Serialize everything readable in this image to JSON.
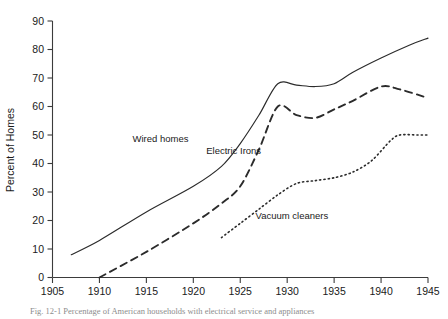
{
  "figure": {
    "caption": "Fig. 12-1  Percentage of American households with electrical service and appliances"
  },
  "chart_data": {
    "type": "line",
    "title": "",
    "xlabel": "",
    "ylabel": "Percent of Homes",
    "xlim": [
      1905,
      1945
    ],
    "ylim": [
      0,
      90
    ],
    "xticks": [
      1905,
      1910,
      1915,
      1920,
      1925,
      1930,
      1935,
      1940,
      1945
    ],
    "yticks": [
      0,
      10,
      20,
      30,
      40,
      50,
      60,
      70,
      80,
      90
    ],
    "grid": false,
    "legend_position": "inline-labels",
    "series": [
      {
        "name": "Wired homes",
        "style": "solid",
        "label_x": 1916.5,
        "label_y": 47.5,
        "x": [
          1907,
          1910,
          1915,
          1920,
          1923,
          1925,
          1927,
          1929,
          1931,
          1933,
          1935,
          1937,
          1940,
          1943,
          1945
        ],
        "values": [
          8,
          13,
          23,
          32,
          39,
          47,
          57,
          68,
          67.5,
          67,
          68,
          72,
          77,
          81.5,
          84
        ]
      },
      {
        "name": "Electric Irons",
        "style": "dashed",
        "label_x": 1924.3,
        "label_y": 43.5,
        "x": [
          1910,
          1915,
          1920,
          1923,
          1925,
          1927,
          1929,
          1931,
          1933,
          1935,
          1937,
          1940,
          1942,
          1945
        ],
        "values": [
          0,
          9,
          19,
          26,
          32,
          45,
          60,
          57,
          56,
          59,
          62,
          67,
          66,
          63
        ]
      },
      {
        "name": "Vacuum cleaners",
        "style": "dotted",
        "label_x": 1930.5,
        "label_y": 20.5,
        "x": [
          1923,
          1925,
          1927,
          1929,
          1931,
          1933,
          1935,
          1937,
          1939,
          1941,
          1942,
          1944,
          1945
        ],
        "values": [
          14,
          19,
          24,
          29,
          33,
          34,
          35,
          37,
          41,
          48,
          50,
          50,
          50
        ]
      }
    ]
  },
  "axis": {
    "y_title": "Percent of Homes",
    "y_tick_labels": [
      "0",
      "10",
      "20",
      "30",
      "40",
      "50",
      "60",
      "70",
      "80",
      "90"
    ],
    "x_tick_labels": [
      "1905",
      "1910",
      "1915",
      "1920",
      "1925",
      "1930",
      "1935",
      "1940",
      "1945"
    ]
  }
}
